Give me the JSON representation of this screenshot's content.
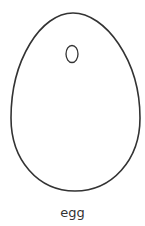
{
  "figure": {
    "label": "egg",
    "stroke_color": "#333333",
    "background": "#ffffff"
  }
}
